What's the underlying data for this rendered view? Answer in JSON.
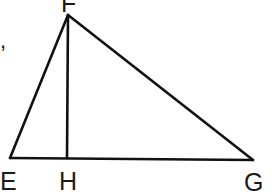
{
  "diagram": {
    "type": "triangle-with-altitude",
    "vertices": {
      "F": {
        "label": "F",
        "x": 68,
        "y": 15
      },
      "E": {
        "label": "E",
        "x": 10,
        "y": 158
      },
      "H": {
        "label": "H",
        "x": 67,
        "y": 158
      },
      "G": {
        "label": "G",
        "x": 253,
        "y": 160
      }
    },
    "segments": [
      "EF",
      "FG",
      "EG",
      "FH"
    ],
    "stray_mark": ","
  }
}
